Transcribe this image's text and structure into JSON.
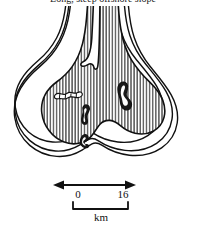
{
  "figure": {
    "caption": "Long, steep offshore slope",
    "kind": "bathymetric-contour-map"
  },
  "scale": {
    "start_label": "0",
    "end_label": "16",
    "unit_label": "km",
    "arrow_name": "scale-arrow",
    "bracket_name": "scale-bracket"
  },
  "map": {
    "landmass_name": "hatched-landmass",
    "hatch_style": "vertical-lines",
    "contour_count": 4,
    "features": [
      {
        "name": "feature-upper-left",
        "label": ""
      },
      {
        "name": "feature-upper-right",
        "label": ""
      },
      {
        "name": "feature-center",
        "label": ""
      },
      {
        "name": "feature-lower-center",
        "label": ""
      }
    ],
    "inlet_name": "top-inlet-notch"
  },
  "colors": {
    "ink": "#111111",
    "paper": "#ffffff",
    "hatch": "#222222"
  }
}
